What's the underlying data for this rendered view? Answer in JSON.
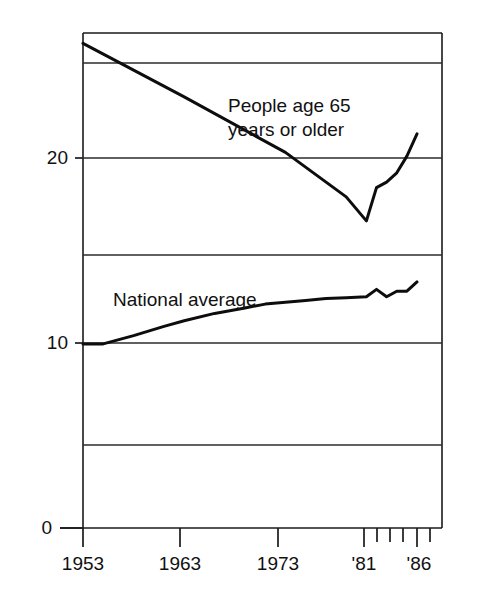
{
  "chart_data": {
    "type": "line",
    "title": "",
    "subtitle": "",
    "xlabel": "",
    "ylabel": "",
    "xlim": [
      1953,
      1986
    ],
    "ylim": [
      0,
      26.8
    ],
    "grid": true,
    "grid_axis": "y",
    "legend_position": "inline-annotation",
    "y_ticks_labeled": [
      "0",
      "10",
      "20"
    ],
    "y_ticks_labeled_values": [
      0,
      10,
      20
    ],
    "y_gridlines": [
      0,
      5,
      10,
      15,
      20,
      25
    ],
    "x_ticks_labeled": [
      "1953",
      "1963",
      "1973",
      "'81",
      "'86"
    ],
    "x_ticks_labeled_values": [
      1953,
      1963,
      1973,
      1981,
      1986
    ],
    "x_minor_ticks": [
      1982,
      1983,
      1984,
      1985
    ],
    "series": [
      {
        "name": "People age 65 years or older",
        "label_line1": "People age 65",
        "label_line2": "years or older",
        "color": "#0d0d0d",
        "x": [
          1953,
          1963,
          1973,
          1979,
          1981,
          1982,
          1983,
          1984,
          1985,
          1986
        ],
        "values": [
          26.2,
          23.3,
          20.3,
          17.9,
          16.6,
          18.4,
          18.7,
          19.2,
          20.1,
          21.3
        ]
      },
      {
        "name": "National average",
        "label_line1": "National average",
        "color": "#0d0d0d",
        "x": [
          1953,
          1955,
          1958,
          1961,
          1963,
          1966,
          1969,
          1971,
          1973,
          1975,
          1977,
          1979,
          1981,
          1982,
          1983,
          1984,
          1985,
          1986
        ],
        "values": [
          9.95,
          9.95,
          10.4,
          10.9,
          11.2,
          11.6,
          11.9,
          12.1,
          12.2,
          12.3,
          12.4,
          12.45,
          12.5,
          12.9,
          12.5,
          12.8,
          12.8,
          13.3
        ]
      }
    ]
  },
  "annotations": {
    "elderly_label": {
      "line1": "People age 65",
      "line2": "years or older"
    },
    "national_label": {
      "line1": "National average"
    }
  },
  "axes": {
    "y_labels": [
      {
        "text": "20",
        "value": 20
      },
      {
        "text": "10",
        "value": 10
      },
      {
        "text": "0",
        "value": 0
      }
    ],
    "x_labels": [
      {
        "text": "1953",
        "value": 1953
      },
      {
        "text": "1963",
        "value": 1963
      },
      {
        "text": "1973",
        "value": 1973
      },
      {
        "text": "'81",
        "value": 1981
      },
      {
        "text": "'86",
        "value": 1986
      }
    ]
  }
}
